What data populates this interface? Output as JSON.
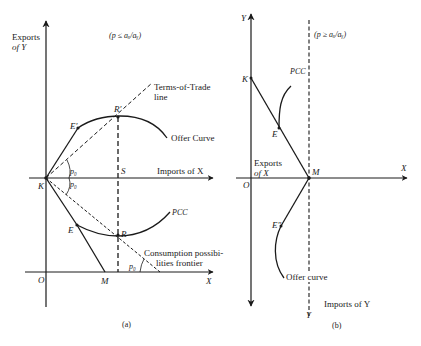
{
  "panel_a": {
    "caption": "(a)",
    "condition": "(p ≤ aₓ/aᵧ)",
    "y_axis_label_line1": "Exports",
    "y_axis_label_line2": "of Y",
    "x_axis_label_upper": "Imports of X",
    "x_axis_label_lower": "X",
    "tot_line_label_line1": "Terms-of-Trade",
    "tot_line_label_line2": "line",
    "offer_curve_label": "Offer Curve",
    "pcc_label": "PCC",
    "cpf_label_line1": "Consumption possibi-",
    "cpf_label_line2": "lities frontier",
    "points": {
      "K": "K",
      "O": "O",
      "M": "M",
      "E": "E",
      "E_prime": "E′",
      "R": "R",
      "R_prime": "R′",
      "S": "S"
    },
    "angle_label": "p₀"
  },
  "panel_b": {
    "caption": "(b)",
    "condition": "(p ≥ aₓ/aᵧ)",
    "y_axis_top_label": "Y",
    "x_axis_label": "X",
    "exports_label_line1": "Exports",
    "exports_label_line2": "of X",
    "imports_label": "Imports of Y",
    "dashed_line_bottom_label": "Y",
    "pcc_label": "PCC",
    "offer_curve_label": "Offer curve",
    "points": {
      "K": "K",
      "O": "O",
      "M": "M",
      "E": "E",
      "E_double_prime": "E″"
    }
  }
}
